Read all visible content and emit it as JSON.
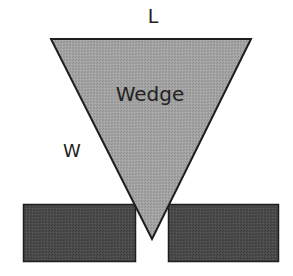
{
  "diagram": {
    "labels": {
      "top_dimension": "L",
      "side_dimension": "W",
      "wedge": "Wedge"
    },
    "colors": {
      "background": "#ffffff",
      "wedge_fill": "#a0a0a0",
      "block_fill": "#4a4a4a",
      "outline": "#1e1e1e",
      "text": "#222222"
    }
  }
}
